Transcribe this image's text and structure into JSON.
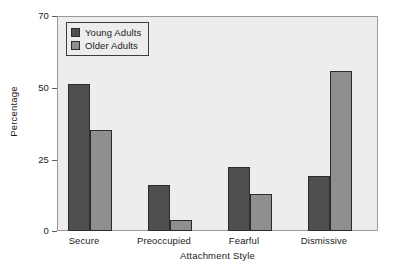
{
  "chart_data": {
    "type": "bar",
    "title": "",
    "xlabel": "Attachment Style",
    "ylabel": "Percentage",
    "categories": [
      "Secure",
      "Preoccupied",
      "Fearful",
      "Dismissive"
    ],
    "series": [
      {
        "name": "Young Adults",
        "color": "#4f4f4f",
        "values": [
          48,
          15,
          21,
          18
        ]
      },
      {
        "name": "Older Adults",
        "color": "#8f8f8f",
        "values": [
          33,
          3.5,
          12,
          52
        ]
      }
    ],
    "ylim": [
      0,
      70
    ],
    "yticks": [
      0,
      25,
      50,
      70
    ],
    "ytick_labels": [
      "0",
      "25",
      "50",
      "70"
    ],
    "grid": false,
    "legend_position": "top-left",
    "plot_background": "#ededed",
    "page_background": "#ffffff"
  }
}
